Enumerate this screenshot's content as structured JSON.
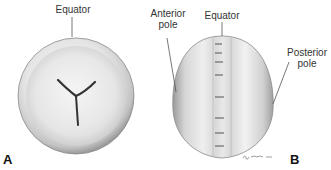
{
  "figure": {
    "panel_a": {
      "letter": "A",
      "labels": {
        "equator": "Equator"
      }
    },
    "panel_b": {
      "letter": "B",
      "labels": {
        "anterior_line1": "Anterior",
        "anterior_line2": "pole",
        "equator": "Equator",
        "posterior_line1": "Posterior",
        "posterior_line2": "pole"
      },
      "signature": "artist-signature"
    }
  }
}
